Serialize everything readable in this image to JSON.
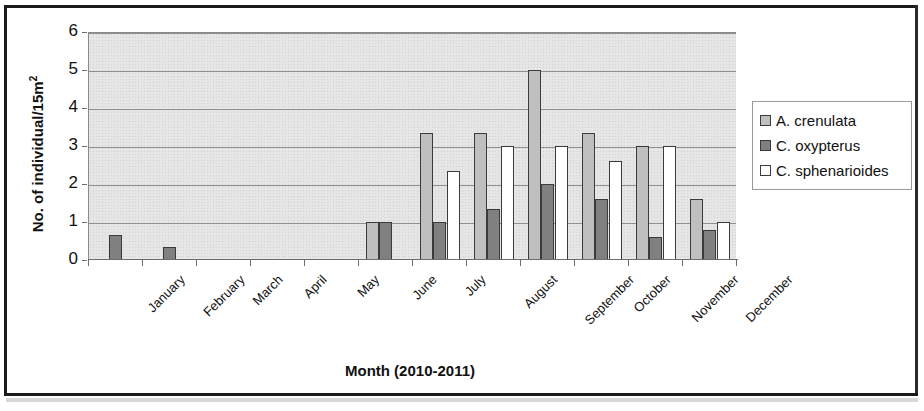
{
  "chart_data": {
    "type": "bar",
    "title": "",
    "xlabel": "Month (2010-2011)",
    "ylabel": "No. of individual/15m",
    "ylabel_sup": "2",
    "ylim": [
      0,
      6
    ],
    "yticks": [
      0,
      1,
      2,
      3,
      4,
      5,
      6
    ],
    "grid": true,
    "legend_position": "right",
    "categories": [
      "January",
      "February",
      "March",
      "April",
      "May",
      "June",
      "July",
      "August",
      "September",
      "October",
      "November",
      "December"
    ],
    "series": [
      {
        "name": "A. crenulata",
        "color": "#bfbfbf",
        "values": [
          0,
          0,
          0,
          0,
          0,
          1.0,
          3.33,
          3.33,
          5.0,
          3.33,
          3.0,
          1.6
        ]
      },
      {
        "name": "C. oxypterus",
        "color": "#808080",
        "values": [
          0.65,
          0.33,
          0,
          0,
          0,
          1.0,
          1.0,
          1.33,
          2.0,
          1.6,
          0.6,
          0.8
        ]
      },
      {
        "name": "C. sphenarioides",
        "color": "#ffffff",
        "values": [
          0,
          0,
          0,
          0,
          0,
          0,
          2.33,
          3.0,
          3.0,
          2.6,
          3.0,
          1.0
        ]
      }
    ]
  },
  "legend": {
    "items": [
      {
        "label": "A. crenulata",
        "swatch": "#bfbfbf"
      },
      {
        "label": "C. oxypterus",
        "swatch": "#808080"
      },
      {
        "label": "C. sphenarioides",
        "swatch": "#ffffff"
      }
    ]
  },
  "axes": {
    "y_title": "No. of individual/15m",
    "y_title_sup": "2",
    "x_title": "Month (2010-2011)"
  }
}
